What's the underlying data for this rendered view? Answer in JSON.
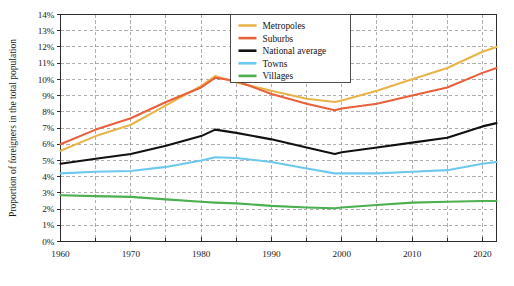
{
  "chart_data": {
    "type": "line",
    "title": "",
    "xlabel": "",
    "ylabel": "Proportion of foreigners in the total population",
    "xlim": [
      1960,
      2022
    ],
    "ylim": [
      0,
      14
    ],
    "grid": true,
    "legend_position": "top-center",
    "y_tick_labels": [
      "0%",
      "1%",
      "2%",
      "3%",
      "4%",
      "5%",
      "6%",
      "7%",
      "8%",
      "9%",
      "10%",
      "11%",
      "12%",
      "13%",
      "14%"
    ],
    "y_tick_values": [
      0,
      1,
      2,
      3,
      4,
      5,
      6,
      7,
      8,
      9,
      10,
      11,
      12,
      13,
      14
    ],
    "x_tick_labels": [
      "1960",
      "1970",
      "1980",
      "1990",
      "2000",
      "2010",
      "2020"
    ],
    "x_tick_values": [
      1960,
      1970,
      1980,
      1990,
      2000,
      2010,
      2020
    ],
    "x_minor_values": [
      1965,
      1975,
      1985,
      1995,
      2005,
      2015
    ],
    "x": [
      1960,
      1965,
      1970,
      1975,
      1980,
      1982,
      1985,
      1990,
      1995,
      1999,
      2000,
      2005,
      2010,
      2015,
      2020,
      2022
    ],
    "series": [
      {
        "name": "Metropoles",
        "color": "#e8b44a",
        "values": [
          5.6,
          6.5,
          7.2,
          8.4,
          9.6,
          10.2,
          9.8,
          9.3,
          8.8,
          8.6,
          8.7,
          9.3,
          10.0,
          10.7,
          11.7,
          12.0
        ]
      },
      {
        "name": "Suburbs",
        "color": "#e8603c",
        "values": [
          6.0,
          6.9,
          7.6,
          8.6,
          9.5,
          10.1,
          9.9,
          9.1,
          8.5,
          8.1,
          8.2,
          8.5,
          9.0,
          9.5,
          10.4,
          10.7
        ]
      },
      {
        "name": "National average",
        "color": "#111111",
        "values": [
          4.8,
          5.1,
          5.4,
          5.9,
          6.5,
          6.9,
          6.7,
          6.3,
          5.8,
          5.4,
          5.5,
          5.8,
          6.1,
          6.4,
          7.1,
          7.3
        ]
      },
      {
        "name": "Towns",
        "color": "#6dc8ee",
        "values": [
          4.2,
          4.3,
          4.35,
          4.6,
          5.0,
          5.2,
          5.15,
          4.9,
          4.5,
          4.2,
          4.2,
          4.2,
          4.3,
          4.4,
          4.8,
          4.9
        ]
      },
      {
        "name": "Villages",
        "color": "#4caf50",
        "values": [
          2.85,
          2.8,
          2.75,
          2.6,
          2.45,
          2.4,
          2.35,
          2.2,
          2.1,
          2.05,
          2.1,
          2.25,
          2.4,
          2.45,
          2.5,
          2.5
        ]
      }
    ]
  },
  "axes": {
    "y_title": "Proportion of foreigners in the total population"
  },
  "legend": {
    "items": [
      {
        "label": "Metropoles",
        "color": "#e8b44a"
      },
      {
        "label": "Suburbs",
        "color": "#e8603c"
      },
      {
        "label": "National average",
        "color": "#111111"
      },
      {
        "label": "Towns",
        "color": "#6dc8ee"
      },
      {
        "label": "Villages",
        "color": "#4caf50"
      }
    ]
  },
  "colors": {
    "grid": "#8c8c8c",
    "frame": "#2b2b2b",
    "background": "#ffffff",
    "text": "#1a1a1a"
  }
}
